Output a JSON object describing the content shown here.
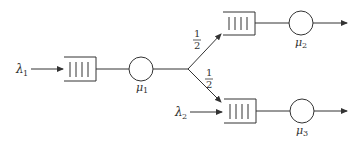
{
  "diagram": {
    "type": "queueing-network",
    "colors": {
      "stroke": "#333333",
      "background": "#ffffff"
    },
    "arrivals": [
      {
        "id": "lambda1",
        "symbol": "λ",
        "subscript": "1",
        "feeds": "queue1"
      },
      {
        "id": "lambda2",
        "symbol": "λ",
        "subscript": "2",
        "feeds": "queue3"
      }
    ],
    "servers": [
      {
        "id": "mu1",
        "symbol": "μ",
        "subscript": "1"
      },
      {
        "id": "mu2",
        "symbol": "μ",
        "subscript": "2"
      },
      {
        "id": "mu3",
        "symbol": "μ",
        "subscript": "3"
      }
    ],
    "routing": [
      {
        "from": "mu1",
        "to": "mu2",
        "probability_num": "1",
        "probability_den": "2"
      },
      {
        "from": "mu1",
        "to": "mu3",
        "probability_num": "1",
        "probability_den": "2"
      }
    ]
  }
}
